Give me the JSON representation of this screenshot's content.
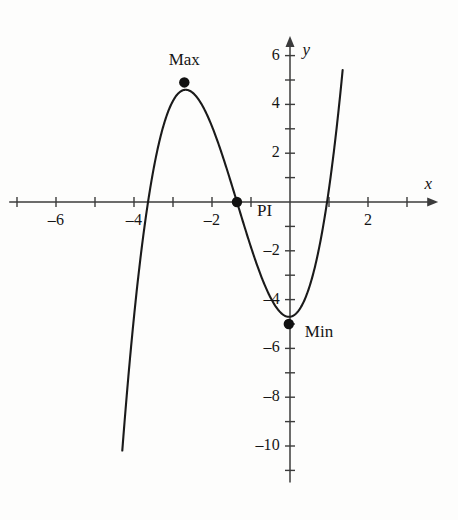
{
  "chart_data": {
    "type": "line",
    "title": "",
    "xlabel": "x",
    "ylabel": "y",
    "xlim": [
      -7.2,
      3.8
    ],
    "ylim": [
      -11.5,
      6.8
    ],
    "grid": false,
    "legend": "none",
    "curve": {
      "name": "cubic",
      "kind": "cubic-polynomial",
      "roots": [
        -3.64,
        -1.36,
        0.95
      ],
      "leading_coefficient": 1,
      "x_start": -4.3,
      "x_end": 1.35,
      "y_at_zero": -5.0
    },
    "x_ticks": [
      -7,
      -6,
      -5,
      -4,
      -3,
      -2,
      -1,
      1,
      2,
      3
    ],
    "x_tick_labels": [
      {
        "value": -6,
        "text": "–6"
      },
      {
        "value": -4,
        "text": "–4"
      },
      {
        "value": -2,
        "text": "–2"
      },
      {
        "value": 2,
        "text": "2"
      }
    ],
    "y_ticks": [
      6,
      5,
      4,
      3,
      2,
      1,
      -1,
      -2,
      -3,
      -4,
      -5,
      -6,
      -7,
      -8,
      -9,
      -10,
      -11
    ],
    "y_tick_labels": [
      {
        "value": 6,
        "text": "6"
      },
      {
        "value": 4,
        "text": "4"
      },
      {
        "value": 2,
        "text": "2"
      },
      {
        "value": -2,
        "text": "–2"
      },
      {
        "value": -4,
        "text": "–4"
      },
      {
        "value": -6,
        "text": "–6"
      },
      {
        "value": -8,
        "text": "–8"
      },
      {
        "value": -10,
        "text": "–10"
      }
    ],
    "annotations": [
      {
        "id": "max",
        "label": "Max",
        "x": -2.71,
        "y": 4.9,
        "label_dx": 0,
        "label_dy": -22,
        "label_align": "center"
      },
      {
        "id": "pi",
        "label": "PI",
        "x": -1.36,
        "y": 0.0,
        "label_dx": 20,
        "label_dy": 9,
        "label_align": "left"
      },
      {
        "id": "min",
        "label": "Min",
        "x": -0.03,
        "y": -5.0,
        "label_dx": 16,
        "label_dy": 8,
        "label_align": "left"
      }
    ],
    "axis_labels": [
      {
        "id": "x-axis-name",
        "text": "x",
        "x": 3.45,
        "y": 0.72
      },
      {
        "id": "y-axis-name",
        "text": "y",
        "x": 0.32,
        "y": 6.25
      }
    ],
    "colors": {
      "curve": "#1a1a1a",
      "axis": "#3b3b3b",
      "point": "#111111",
      "background": "#fdfdfc",
      "text": "#151515"
    }
  }
}
